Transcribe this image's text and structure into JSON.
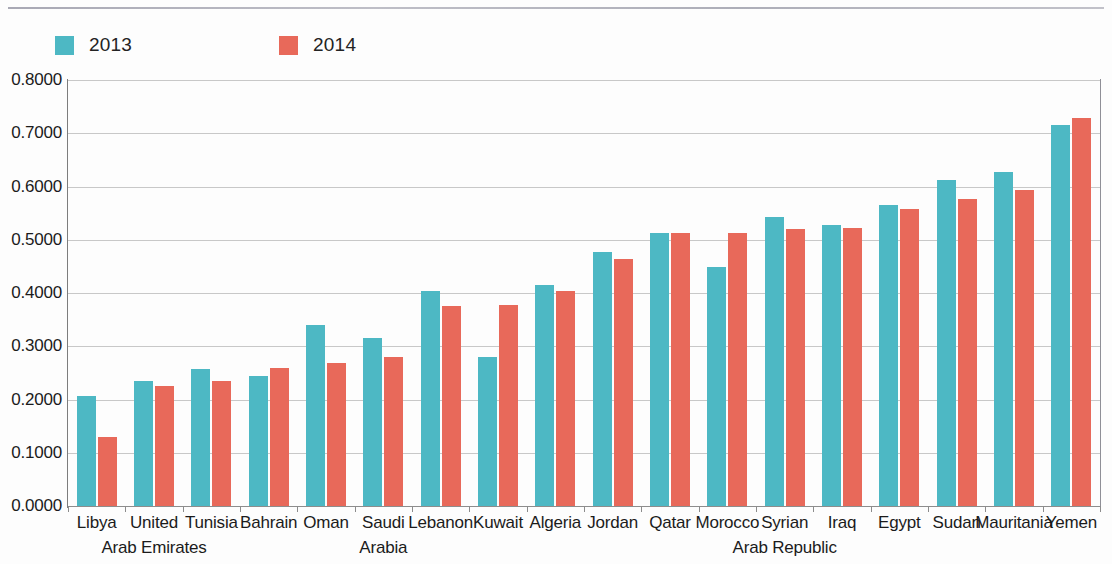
{
  "legend": {
    "items": [
      {
        "label": "2013",
        "color": "#4db8c4"
      },
      {
        "label": "2014",
        "color": "#e8695a"
      }
    ]
  },
  "axis": {
    "y_ticks": [
      "0.0000",
      "0.1000",
      "0.2000",
      "0.3000",
      "0.4000",
      "0.5000",
      "0.6000",
      "0.7000",
      "0.8000"
    ]
  },
  "chart_data": {
    "type": "bar",
    "title": "",
    "subtitle": "",
    "xlabel": "",
    "ylabel": "",
    "ylim": [
      0.0,
      0.8
    ],
    "ytick_step": 0.1,
    "grid": true,
    "legend_position": "top-left",
    "categories": [
      "Libya",
      "United Arab Emirates",
      "Tunisia",
      "Bahrain",
      "Oman",
      "Saudi Arabia",
      "Lebanon",
      "Kuwait",
      "Algeria",
      "Jordan",
      "Qatar",
      "Morocco",
      "Syrian Arab Republic",
      "Iraq",
      "Egypt",
      "Sudan",
      "Mauritania",
      "Yemen"
    ],
    "category_label_lines": [
      [
        "Libya",
        ""
      ],
      [
        "United",
        "Arab Emirates"
      ],
      [
        "Tunisia",
        ""
      ],
      [
        "Bahrain",
        ""
      ],
      [
        "Oman",
        ""
      ],
      [
        "Saudi",
        "Arabia"
      ],
      [
        "Lebanon",
        ""
      ],
      [
        "Kuwait",
        ""
      ],
      [
        "Algeria",
        ""
      ],
      [
        "Jordan",
        ""
      ],
      [
        "Qatar",
        ""
      ],
      [
        "Morocco",
        ""
      ],
      [
        "Syrian",
        "Arab Republic"
      ],
      [
        "Iraq",
        ""
      ],
      [
        "Egypt",
        ""
      ],
      [
        "Sudan",
        ""
      ],
      [
        "Mauritania",
        ""
      ],
      [
        "Yemen",
        ""
      ]
    ],
    "series": [
      {
        "name": "2013",
        "color": "#4db8c4",
        "values": [
          0.207,
          0.235,
          0.258,
          0.245,
          0.34,
          0.315,
          0.403,
          0.28,
          0.415,
          0.477,
          0.513,
          0.448,
          0.543,
          0.528,
          0.565,
          0.612,
          0.628,
          0.716
        ]
      },
      {
        "name": "2014",
        "color": "#e8695a",
        "values": [
          0.129,
          0.225,
          0.234,
          0.259,
          0.269,
          0.279,
          0.375,
          0.377,
          0.404,
          0.463,
          0.512,
          0.512,
          0.52,
          0.523,
          0.557,
          0.577,
          0.593,
          0.728
        ]
      }
    ]
  }
}
